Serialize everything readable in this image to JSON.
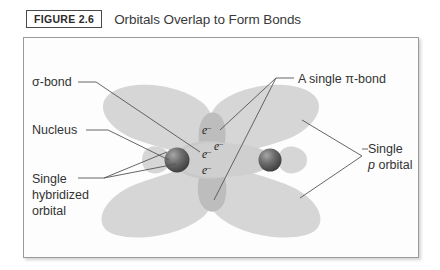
{
  "header": {
    "figure_tag": "FIGURE 2.6",
    "title": "Orbitals Overlap to Form Bonds"
  },
  "labels": {
    "sigma_bond": "σ-bond",
    "nucleus": "Nucleus",
    "single_hybridized_1": "Single",
    "single_hybridized_2": "hybridized",
    "single_hybridized_3": "orbital",
    "pi_bond": "A single π-bond",
    "single_p_1": "Single",
    "single_p_2a": "p",
    "single_p_2b": " orbital"
  },
  "electrons": {
    "pi_upper_1": "e",
    "pi_upper_1_charge": "–",
    "pi_upper_2": "e",
    "pi_upper_2_charge": "–",
    "sigma_1": "e",
    "sigma_1_charge": "–",
    "sigma_2": "e",
    "sigma_2_charge": "–"
  },
  "colors": {
    "lobe_fill": "#d6d6d6",
    "lobe_overlap": "#bdbdbd",
    "nucleus_dark": "#4a4a4a",
    "nucleus_light": "#8e8e8e",
    "frame_border": "#9a9a9a",
    "text": "#333333",
    "leader_line": "#555555",
    "background": "#fdfdfd"
  },
  "diagram": {
    "type": "orbital-overlap-diagram",
    "nucleus_count": 2,
    "p_orbital_lobe_count": 4,
    "hybrid_orbital_back_lobe_count": 2,
    "electron_pair_count": 2
  }
}
